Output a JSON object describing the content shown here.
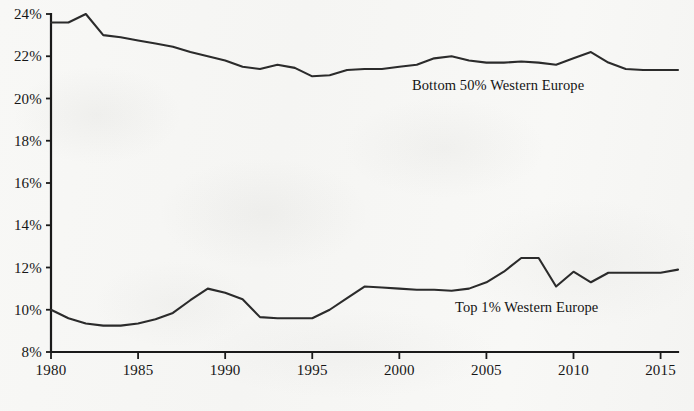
{
  "chart_data": {
    "type": "line",
    "title": "",
    "subtitle": "",
    "xlabel": "",
    "ylabel": "",
    "xlim": [
      1980,
      2016
    ],
    "ylim": [
      8,
      24
    ],
    "grid": false,
    "legend_position": "inline-annotation",
    "y_tick_labels": [
      "24%",
      "22%",
      "20%",
      "18%",
      "16%",
      "14%",
      "12%",
      "10%",
      "8%"
    ],
    "y_ticks": [
      24,
      22,
      20,
      18,
      16,
      14,
      12,
      10,
      8
    ],
    "x_tick_labels": [
      "1980",
      "1985",
      "1990",
      "1995",
      "2000",
      "2005",
      "2010",
      "2015"
    ],
    "x_ticks": [
      1980,
      1985,
      1990,
      1995,
      2000,
      2005,
      2010,
      2015
    ],
    "x": [
      1980,
      1981,
      1982,
      1983,
      1984,
      1985,
      1986,
      1987,
      1988,
      1989,
      1990,
      1991,
      1992,
      1993,
      1994,
      1995,
      1996,
      1997,
      1998,
      1999,
      2000,
      2001,
      2002,
      2003,
      2004,
      2005,
      2006,
      2007,
      2008,
      2009,
      2010,
      2011,
      2012,
      2013,
      2014,
      2015,
      2016
    ],
    "series": [
      {
        "name": "Bottom 50% Western Europe",
        "label": "Bottom 50%  Western Europe",
        "color": "#2b2b2b",
        "values": [
          23.6,
          23.6,
          24.0,
          23.0,
          22.9,
          22.75,
          22.6,
          22.45,
          22.2,
          22.0,
          21.8,
          21.5,
          21.4,
          21.6,
          21.45,
          21.05,
          21.1,
          21.35,
          21.4,
          21.4,
          21.5,
          21.6,
          21.9,
          22.0,
          21.8,
          21.7,
          21.7,
          21.75,
          21.7,
          21.6,
          21.9,
          22.2,
          21.7,
          21.4,
          21.35,
          21.35,
          21.35
        ]
      },
      {
        "name": "Top 1% Western Europe",
        "label": "Top 1%  Western Europe",
        "color": "#2b2b2b",
        "values": [
          10.0,
          9.6,
          9.35,
          9.25,
          9.25,
          9.35,
          9.55,
          9.85,
          10.45,
          11.0,
          10.8,
          10.5,
          9.65,
          9.6,
          9.6,
          9.6,
          10.0,
          10.55,
          11.1,
          11.05,
          11.0,
          10.95,
          10.95,
          10.9,
          11.0,
          11.3,
          11.8,
          12.45,
          12.45,
          11.1,
          11.8,
          11.3,
          11.75,
          11.75,
          11.75,
          11.75,
          11.9
        ]
      }
    ]
  },
  "annotations": {
    "bottom50_label": "Bottom 50%  Western Europe",
    "top1_label": "Top 1%  Western Europe"
  }
}
